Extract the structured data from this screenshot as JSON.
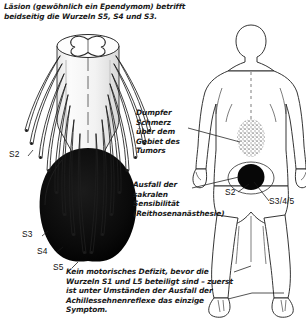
{
  "figure": {
    "caption_top": "Läsion (gewöhnlich ein Ependymom) betrifft beidseitig die Wurzeln S5, S4 und S3.",
    "caption_bottom": "Kein motorisches Defizit, bevor die Wurzeln S1 und L5 beteiligt sind – zuerst ist unter Umständen der Ausfall der Achillessehnenreflexe das einzige Symptom."
  },
  "labels": {
    "dull_pain": "Dumpfer Schmerz über dem Gebiet des Tumors",
    "sensory_loss": "Ausfall der sakralen Sensibilität (Reithosenanästhesie)"
  },
  "left_diagram": {
    "name": "conus-medullaris-with-ependymoma",
    "roots": [
      {
        "id": "s2",
        "label": "S2"
      },
      {
        "id": "s3",
        "label": "S3"
      },
      {
        "id": "s4",
        "label": "S4"
      },
      {
        "id": "s5",
        "label": "S5"
      }
    ]
  },
  "right_diagram": {
    "name": "posterior-body-dermatomes",
    "roots": [
      {
        "id": "s2",
        "label": "S2"
      },
      {
        "id": "s345",
        "label": "S3/4/5"
      }
    ],
    "regions": [
      {
        "id": "tumor-pain-area",
        "style": "stippled-oval"
      },
      {
        "id": "saddle-anesthesia-area",
        "style": "solid-black-circle"
      }
    ]
  },
  "colors": {
    "ink": "#1a1a1a",
    "tumor_black": "#0d0d0d",
    "stipple_gray": "#8d8d8d",
    "paper": "#ffffff"
  }
}
